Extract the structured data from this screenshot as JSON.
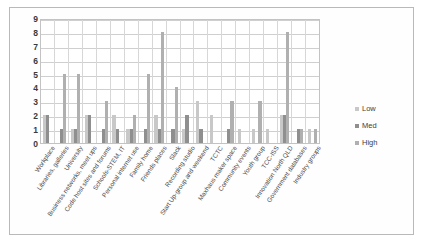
{
  "chart_data": {
    "type": "bar",
    "title": "",
    "subtitle": "",
    "xlabel": "",
    "ylabel": "",
    "ylim": [
      0,
      9
    ],
    "yticks": [
      9,
      8,
      7,
      6,
      5,
      4,
      3,
      2,
      1,
      0
    ],
    "grid": true,
    "legend_position": "right",
    "categories": [
      "Workplace",
      "Libraries, galleries",
      "University",
      "Business networks, meet ups",
      "Code host sites and forums",
      "Schools-STEM, IT",
      "Personal internet use",
      "Family home",
      "Friends places",
      "Slack",
      "Recording studio",
      "Start Up-group and weekend",
      "TCTC",
      "Maxhaus maker space",
      "Community events",
      "Youth group",
      "TCC-ISS",
      "Innovation North QLD",
      "Government databases",
      "Industry groups"
    ],
    "series": [
      {
        "name": "Low",
        "color": "#c8c8c8",
        "values": [
          2,
          0,
          1,
          2,
          0,
          2,
          1,
          0,
          2,
          0,
          1,
          3,
          2,
          0,
          1,
          1,
          1,
          2,
          0,
          1
        ]
      },
      {
        "name": "Med",
        "color": "#8f8f8f",
        "values": [
          2,
          1,
          1,
          2,
          1,
          1,
          1,
          1,
          1,
          1,
          2,
          1,
          0,
          1,
          0,
          0,
          0,
          2,
          1,
          0
        ]
      },
      {
        "name": "High",
        "color": "#b0b0b0",
        "values": [
          0,
          5,
          5,
          0,
          3,
          0,
          2,
          5,
          8,
          4,
          0,
          0,
          0,
          3,
          0,
          3,
          0,
          8,
          1,
          1
        ]
      }
    ]
  },
  "legend": {
    "items": [
      {
        "label": "Low",
        "key": "low"
      },
      {
        "label": "Med",
        "key": "med"
      },
      {
        "label": "High",
        "key": "high"
      }
    ]
  }
}
